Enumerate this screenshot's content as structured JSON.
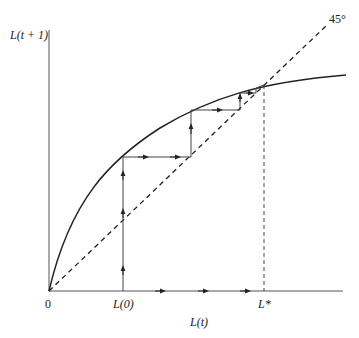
{
  "diagram": {
    "y_axis_label": "L(t + 1)",
    "x_axis_label": "L(t)",
    "origin_label": "0",
    "x_ticks": [
      {
        "label": "L(0)",
        "x": 123
      },
      {
        "label": "L*",
        "x": 264
      }
    ],
    "diagonal_label": "45°",
    "colors": {
      "line": "#222222",
      "axis": "#444444"
    },
    "geometry": {
      "origin": [
        49,
        291
      ],
      "curve_end": [
        346,
        75
      ],
      "fixed_point": [
        264,
        85
      ],
      "cobweb": [
        [
          123,
          291
        ],
        [
          123,
          157
        ],
        [
          191,
          157
        ],
        [
          191,
          110
        ],
        [
          240,
          110
        ],
        [
          240,
          93
        ],
        [
          256,
          93
        ],
        [
          256,
          88
        ],
        [
          264,
          85
        ]
      ]
    }
  }
}
